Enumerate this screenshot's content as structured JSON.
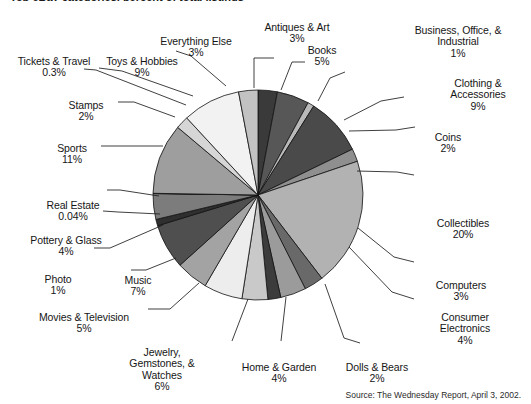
{
  "title": "Top eBay categories, percent of total listings",
  "source": "Source: The Wednesday Report, April 3, 2002.",
  "chart_data": {
    "type": "pie",
    "title": "Top eBay categories, percent of total listings",
    "unit": "%",
    "legend": "none",
    "labels_position": "outside-with-leader-lines",
    "start_angle_deg": 0,
    "direction": "clockwise",
    "categories": [
      "Antiques & Art",
      "Books",
      "Business, Office, & Industrial",
      "Clothing & Accessories",
      "Coins",
      "Collectibles",
      "Computers",
      "Consumer Electronics",
      "Dolls & Bears",
      "Home & Garden",
      "Jewelry, Gemstones, & Watches",
      "Movies & Television",
      "Music",
      "Photo",
      "Pottery & Glass",
      "Real Estate",
      "Sports",
      "Stamps",
      "Toys & Hobbies",
      "Everything Else"
    ],
    "values": [
      3,
      5,
      1,
      9,
      2,
      20,
      3,
      4,
      2,
      4,
      6,
      5,
      7,
      1,
      4,
      0.04,
      11,
      2,
      9,
      3
    ],
    "value_labels": [
      "3%",
      "5%",
      "1%",
      "9%",
      "2%",
      "20%",
      "3%",
      "4%",
      "2%",
      "4%",
      "6%",
      "5%",
      "7%",
      "1%",
      "4%",
      "0.04%",
      "11%",
      "2%",
      "9%",
      "3%"
    ],
    "colors": [
      "#3a3a3a",
      "#575757",
      "#b9b9b9",
      "#4a4a4a",
      "#8f8f8f",
      "#b2b2b2",
      "#696969",
      "#9b9b9b",
      "#3c3c3c",
      "#c9c9c9",
      "#ededed",
      "#a3a3a3",
      "#4f4f4f",
      "#2f2f2f",
      "#7c7c7c",
      "#555555",
      "#9e9e9e",
      "#d6d6d6",
      "#f2f2f2",
      "#c2c2c2"
    ]
  },
  "labels": [
    {
      "name": "antiques-and-art",
      "text": "Antiques & Art",
      "pct": "3%"
    },
    {
      "name": "books",
      "text": "Books",
      "pct": "5%"
    },
    {
      "name": "business-office-industrial",
      "text": "Business, Office, &\nIndustrial",
      "pct": "1%"
    },
    {
      "name": "clothing-accessories",
      "text": "Clothing &\nAccessories",
      "pct": "9%"
    },
    {
      "name": "coins",
      "text": "Coins",
      "pct": "2%"
    },
    {
      "name": "collectibles",
      "text": "Collectibles",
      "pct": "20%"
    },
    {
      "name": "computers",
      "text": "Computers",
      "pct": "3%"
    },
    {
      "name": "consumer-electronics",
      "text": "Consumer\nElectronics",
      "pct": "4%"
    },
    {
      "name": "dolls-and-bears",
      "text": "Dolls & Bears",
      "pct": "2%"
    },
    {
      "name": "home-and-garden",
      "text": "Home & Garden",
      "pct": "4%"
    },
    {
      "name": "jewelry-gemstones-watches",
      "text": "Jewelry,\nGemstones, &\nWatches",
      "pct": "6%"
    },
    {
      "name": "movies-and-television",
      "text": "Movies & Television",
      "pct": "5%"
    },
    {
      "name": "music",
      "text": "Music",
      "pct": "7%"
    },
    {
      "name": "photo",
      "text": "Photo",
      "pct": "1%"
    },
    {
      "name": "pottery-and-glass",
      "text": "Pottery & Glass",
      "pct": "4%"
    },
    {
      "name": "real-estate",
      "text": "Real Estate",
      "pct": "0.04%"
    },
    {
      "name": "sports",
      "text": "Sports",
      "pct": "11%"
    },
    {
      "name": "stamps",
      "text": "Stamps",
      "pct": "2%"
    },
    {
      "name": "toys-and-hobbies",
      "text": "Toys & Hobbies",
      "pct": "9%"
    },
    {
      "name": "everything-else",
      "text": "Everything Else",
      "pct": "3%"
    },
    {
      "name": "tickets-and-travel",
      "text": "Tickets & Travel",
      "pct": "0.3%"
    }
  ]
}
